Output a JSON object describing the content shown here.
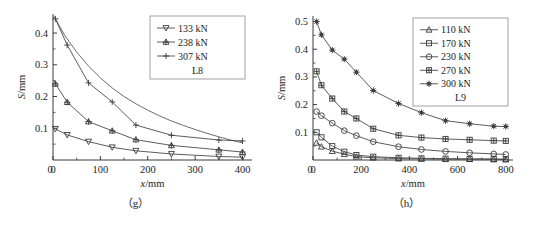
{
  "figure": {
    "background": "#ffffff",
    "line_color": "#4a4a4a",
    "axis_color": "#3a3a3a",
    "text_color": "#1c1c1c"
  },
  "panels": [
    {
      "caption": "（g）",
      "caption_name": "panel-caption-g"
    },
    {
      "caption": "（h）",
      "caption_name": "panel-caption-h"
    }
  ],
  "chart_data": [
    {
      "type": "line",
      "title": "",
      "subtitle": "",
      "panel_label": "（g）",
      "group_label": "L8",
      "xlabel": "x/mm",
      "ylabel": "S/mm",
      "xlim": [
        0,
        420
      ],
      "ylim": [
        0,
        0.46
      ],
      "xticks": [
        0,
        100,
        200,
        300,
        400
      ],
      "yticks": [
        0.1,
        0.2,
        0.3,
        0.4
      ],
      "xtick_labels": [
        "0",
        "100",
        "200",
        "300",
        "400"
      ],
      "ytick_labels": [
        "0.1",
        "0.2",
        "0.3",
        "0.4"
      ],
      "x_minor_step": 50,
      "y_minor_step": 0.05,
      "grid": false,
      "legend_position": "top-right",
      "x": [
        5,
        30,
        75,
        125,
        175,
        250,
        350,
        400
      ],
      "series": [
        {
          "name": "133 kN",
          "marker": "triangle-down",
          "filled": false,
          "values": [
            0.098,
            0.079,
            0.058,
            0.04,
            0.029,
            0.019,
            0.011,
            0.009
          ]
        },
        {
          "name": "238 kN",
          "marker": "star-triangle",
          "filled": false,
          "values": [
            0.24,
            0.182,
            0.121,
            0.092,
            0.064,
            0.046,
            0.032,
            0.025
          ]
        },
        {
          "name": "307 kN",
          "marker": "plus",
          "filled": false,
          "values": [
            0.445,
            0.362,
            0.243,
            0.183,
            0.11,
            0.078,
            0.063,
            0.06
          ]
        }
      ],
      "fit_curve": {
        "name": "smooth-fit",
        "x": [
          5,
          25,
          50,
          75,
          100,
          125,
          150,
          175,
          200,
          225,
          250,
          275,
          300,
          325,
          350,
          375,
          400
        ],
        "values": [
          0.445,
          0.392,
          0.34,
          0.296,
          0.259,
          0.227,
          0.2,
          0.177,
          0.157,
          0.139,
          0.123,
          0.109,
          0.096,
          0.084,
          0.073,
          0.063,
          0.054
        ]
      }
    },
    {
      "type": "line",
      "title": "",
      "subtitle": "",
      "panel_label": "（h）",
      "group_label": "L9",
      "xlabel": "x/mm",
      "ylabel": "S/mm",
      "xlim": [
        0,
        830
      ],
      "ylim": [
        0,
        0.52
      ],
      "xticks": [
        0,
        200,
        400,
        600,
        800
      ],
      "yticks": [
        0.1,
        0.2,
        0.3,
        0.4,
        0.5
      ],
      "xtick_labels": [
        "0",
        "200",
        "400",
        "600",
        "800"
      ],
      "ytick_labels": [
        "0.1",
        "0.2",
        "0.3",
        "0.4",
        "0.5"
      ],
      "x_minor_step": 100,
      "y_minor_step": 0.05,
      "grid": false,
      "legend_position": "top-right",
      "x": [
        15,
        35,
        80,
        130,
        180,
        250,
        355,
        450,
        550,
        650,
        750,
        800
      ],
      "series": [
        {
          "name": "110 kN",
          "marker": "triangle-up",
          "filled": false,
          "values": [
            0.062,
            0.048,
            0.032,
            0.021,
            0.012,
            0.008,
            0.005,
            0.004,
            0.003,
            0.003,
            0.002,
            0.002
          ]
        },
        {
          "name": "170 kN",
          "marker": "square",
          "filled": false,
          "values": [
            0.1,
            0.082,
            0.05,
            0.03,
            0.018,
            0.012,
            0.008,
            0.006,
            0.005,
            0.004,
            0.004,
            0.003
          ]
        },
        {
          "name": "230 kN",
          "marker": "circle",
          "filled": false,
          "values": [
            0.175,
            0.16,
            0.133,
            0.106,
            0.088,
            0.066,
            0.048,
            0.038,
            0.031,
            0.026,
            0.022,
            0.02
          ]
        },
        {
          "name": "270 kN",
          "marker": "square-cross",
          "filled": false,
          "values": [
            0.32,
            0.27,
            0.222,
            0.175,
            0.15,
            0.113,
            0.089,
            0.081,
            0.076,
            0.073,
            0.07,
            0.069
          ]
        },
        {
          "name": "300 kN",
          "marker": "star",
          "filled": true,
          "values": [
            0.5,
            0.452,
            0.397,
            0.364,
            0.317,
            0.251,
            0.204,
            0.171,
            0.142,
            0.131,
            0.122,
            0.121
          ]
        }
      ]
    }
  ]
}
